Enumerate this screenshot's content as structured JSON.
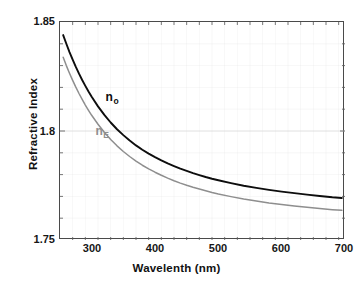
{
  "chart_data": {
    "type": "line",
    "title": "",
    "xlabel": "Wavelenth (nm)",
    "ylabel": "Refractive Index",
    "xlim": [
      250,
      700
    ],
    "ylim": [
      1.75,
      1.85
    ],
    "xticks": [
      300,
      400,
      500,
      600,
      700
    ],
    "xtick_labels": [
      "300",
      "400",
      "500",
      "600",
      "700"
    ],
    "yticks": [
      1.75,
      1.8,
      1.85
    ],
    "ytick_labels": [
      "1.75",
      "1.8",
      "1.85"
    ],
    "x_minor_tick_step": 20,
    "y_minor_tick_step": 0.01,
    "grid": true,
    "grid_color": "#d8d8d8",
    "legend_position": "inline-annotation",
    "x": [
      255,
      260,
      265,
      270,
      275,
      280,
      285,
      290,
      295,
      300,
      310,
      320,
      330,
      340,
      350,
      360,
      370,
      380,
      390,
      400,
      410,
      420,
      430,
      440,
      450,
      460,
      470,
      480,
      490,
      500,
      520,
      540,
      560,
      580,
      600,
      620,
      640,
      660,
      680,
      695
    ],
    "series": [
      {
        "name": "n_o",
        "label": "n",
        "sublabel": "o",
        "color": "#0d0d0d",
        "width": 1.9,
        "values": [
          1.844,
          1.84,
          1.8362,
          1.8327,
          1.8294,
          1.8263,
          1.8234,
          1.8207,
          1.8181,
          1.8157,
          1.8113,
          1.8074,
          1.8039,
          1.8008,
          1.7981,
          1.7956,
          1.7934,
          1.7914,
          1.7896,
          1.788,
          1.7865,
          1.7851,
          1.7839,
          1.7827,
          1.7817,
          1.7807,
          1.7798,
          1.7789,
          1.7781,
          1.7774,
          1.7761,
          1.7749,
          1.7739,
          1.773,
          1.7722,
          1.7715,
          1.7708,
          1.7702,
          1.7696,
          1.7693
        ]
      },
      {
        "name": "n_E",
        "label": "n",
        "sublabel": "E",
        "color": "#8e8e8e",
        "width": 1.5,
        "values": [
          1.8338,
          1.83,
          1.8265,
          1.8232,
          1.8201,
          1.8172,
          1.8145,
          1.8119,
          1.8095,
          1.8072,
          1.8031,
          1.7994,
          1.7961,
          1.7932,
          1.7906,
          1.7883,
          1.7862,
          1.7843,
          1.7826,
          1.7811,
          1.7797,
          1.7784,
          1.7772,
          1.7761,
          1.7751,
          1.7742,
          1.7734,
          1.7726,
          1.7718,
          1.7711,
          1.7699,
          1.7688,
          1.7679,
          1.767,
          1.7663,
          1.7656,
          1.765,
          1.7644,
          1.7639,
          1.7636
        ]
      }
    ],
    "annotations": [
      {
        "name": "n-sub-o",
        "text": "n",
        "sub": "o",
        "x": 322,
        "y": 1.8152,
        "color": "#0d0d0d"
      },
      {
        "name": "n-sub-E",
        "text": "n",
        "sub": "E",
        "x": 306,
        "y": 1.7995,
        "color": "#8e8e8e"
      }
    ]
  }
}
